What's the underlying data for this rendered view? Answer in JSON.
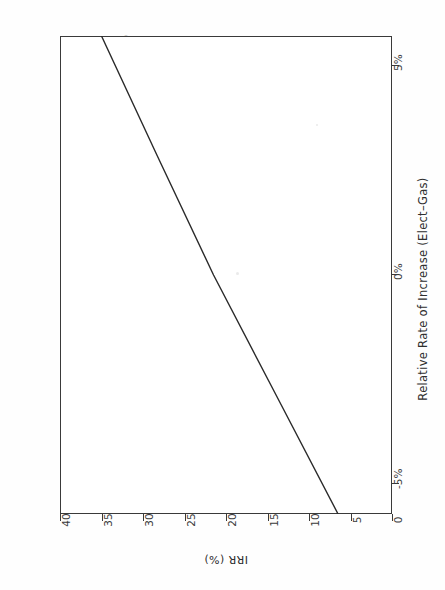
{
  "figure": {
    "title_line1": "FIGURE 11-17",
    "title_line2": "IRR VS. RELATIVE ELECTRIC & GAS RATES – CHEMCO"
  },
  "chart_data": {
    "type": "line",
    "title": "IRR VS. RELATIVE ELECTRIC & GAS RATES – CHEMCO",
    "subtitle": "FIGURE 11-17",
    "xlabel": "Relative Rate of Increase (Elect–Gas)",
    "ylabel": "IRR (%)",
    "orientation": "page-rotated-90-ccw",
    "grid": false,
    "legend": "none",
    "xlim": [
      -5,
      5
    ],
    "ylim": [
      0,
      40
    ],
    "x_tick_labels": [
      "-5%",
      "0%",
      "5%"
    ],
    "x_tick_values": [
      -5,
      0,
      5
    ],
    "y_tick_labels": [
      "0",
      "5",
      "10",
      "15",
      "20",
      "25",
      "30",
      "35",
      "40"
    ],
    "y_tick_values": [
      0,
      5,
      10,
      15,
      20,
      25,
      30,
      35,
      40
    ],
    "series": [
      {
        "name": "IRR",
        "x": [
          -5.0,
          -2.5,
          0.0,
          2.5,
          5.0
        ],
        "values": [
          6.5,
          14.0,
          21.5,
          28.3,
          35.0
        ]
      }
    ],
    "annotations": []
  },
  "axes": {
    "x": {
      "label": "Relative Rate of Increase (Elect–Gas)",
      "ticks": [
        {
          "label": "5%",
          "value": 5
        },
        {
          "label": "0%",
          "value": 0
        },
        {
          "label": "-5%",
          "value": -5
        }
      ]
    },
    "y": {
      "label": "IRR (%)",
      "ticks": [
        {
          "label": "40",
          "value": 40
        },
        {
          "label": "35",
          "value": 35
        },
        {
          "label": "30",
          "value": 30
        },
        {
          "label": "25",
          "value": 25
        },
        {
          "label": "20",
          "value": 20
        },
        {
          "label": "15",
          "value": 15
        },
        {
          "label": "10",
          "value": 10
        },
        {
          "label": "5",
          "value": 5
        },
        {
          "label": "0",
          "value": 0
        }
      ]
    }
  },
  "colors": {
    "ink": "#3a3a3a",
    "text": "#2e2e2e",
    "paper": "#fefefe",
    "line": "#2a2a2a"
  }
}
